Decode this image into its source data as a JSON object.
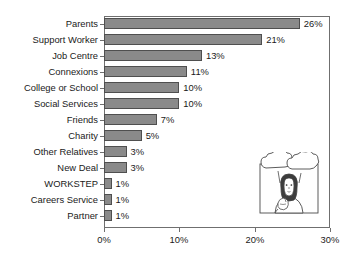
{
  "chart_data": {
    "type": "bar",
    "orientation": "horizontal",
    "title": "",
    "title_note": "cropped off at top edge of image, unreadable",
    "xlabel": "",
    "ylabel": "",
    "categories": [
      "Parents",
      "Support Worker",
      "Job Centre",
      "Connexions",
      "College or School",
      "Social Services",
      "Friends",
      "Charity",
      "Other Relatives",
      "New Deal",
      "WORKSTEP",
      "Careers Service",
      "Partner"
    ],
    "values": [
      26,
      21,
      13,
      11,
      10,
      10,
      7,
      5,
      3,
      3,
      1,
      1,
      1
    ],
    "data_labels": [
      "26%",
      "21%",
      "13%",
      "11%",
      "10%",
      "10%",
      "7%",
      "5%",
      "3%",
      "3%",
      "1%",
      "1%",
      "1%"
    ],
    "xlim": [
      0,
      30
    ],
    "xticks": [
      0,
      10,
      20,
      30
    ],
    "xtick_labels": [
      "0%",
      "10%",
      "20%",
      "30%"
    ],
    "grid": false,
    "legend": null,
    "bar_color": "#8a8a8a",
    "bar_border_color": "#4f4f4f",
    "frame_color": "#6f6f6f",
    "background_color": "#ffffff",
    "text_color": "#1a1a1a"
  },
  "illustration": {
    "description": "line drawing of a person with long hair, hand to chin in a thinking pose, with two empty thought bubbles above",
    "bubble_1_text": "",
    "bubble_2_text": ""
  }
}
